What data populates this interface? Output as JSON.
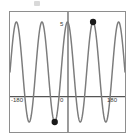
{
  "figure": {
    "background_color": "#ffffff",
    "frame_color": "#8e8e8e",
    "curve_color": "#7c7c7c",
    "axis_color": "#555555",
    "point_color": "#1a1a1a",
    "scan_artifact": "scan-speck"
  },
  "labels": {
    "x_min": "-180",
    "x_max": "180",
    "origin": "0",
    "y_max": "5"
  },
  "chart_data": {
    "type": "line",
    "title": "",
    "subtitle": "",
    "xlabel": "",
    "ylabel": "",
    "xlim": [
      -180,
      180
    ],
    "ylim": [
      -6,
      6
    ],
    "xticks": [
      -180,
      0,
      180
    ],
    "xticklabels": [
      "-180",
      "0",
      "180"
    ],
    "yticks": [
      5
    ],
    "yticklabels": [
      "5"
    ],
    "grid": false,
    "legend": null,
    "series": [
      {
        "name": "y = 5 cos(4.5x)",
        "equation": "y = 5*cos(4.5 * x_deg)",
        "amplitude": 5,
        "period_degrees": 80,
        "cycles_visible": 4.5,
        "color": "#7c7c7c",
        "linewidth": 1.4,
        "x": [
          -180,
          -160,
          -140,
          -120,
          -100,
          -80,
          -60,
          -40,
          -20,
          0,
          20,
          40,
          60,
          80,
          100,
          120,
          140,
          160,
          180
        ],
        "y": [
          5,
          -5,
          5,
          -5,
          5,
          -5,
          5,
          -5,
          5,
          5,
          -5,
          5,
          -5,
          5,
          -5,
          5,
          -5,
          5,
          5
        ]
      }
    ],
    "annotated_points": [
      {
        "name": "maximum-point",
        "x": 80,
        "y": 5,
        "marker": "filled-circle",
        "color": "#1a1a1a",
        "label": ""
      },
      {
        "name": "minimum-point",
        "x": -40,
        "y": -5,
        "marker": "filled-circle",
        "color": "#1a1a1a",
        "label": ""
      }
    ]
  }
}
